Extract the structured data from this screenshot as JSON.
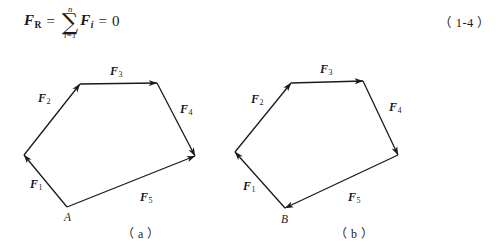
{
  "equation": {
    "lhs_symbol": "F",
    "lhs_subscript": "R",
    "equals_1": "=",
    "sum_upper": "n",
    "sum_symbol": "∑",
    "sum_lower": "i=1",
    "term_symbol": "F",
    "term_subscript": "i",
    "equals_2": "=",
    "rhs": "0",
    "number": "（ 1-4 ）"
  },
  "style": {
    "stroke_color": "#1a1a1a",
    "background": "#ffffff",
    "stroke_width": 1.3
  },
  "figures": [
    {
      "id": "figure-a",
      "caption": "（ a ）",
      "caption_x": 122,
      "caption_y": 228,
      "point_label": "A",
      "point_label_x": 64,
      "point_label_y": 212,
      "open_polygon": true,
      "vertices": {
        "A": [
          67,
          207
        ],
        "P1": [
          24,
          155
        ],
        "P2": [
          80,
          84
        ],
        "P3": [
          157,
          83
        ],
        "P4": [
          195,
          156
        ]
      },
      "forces": [
        {
          "name": "F",
          "sub": "1",
          "label_x": 30,
          "label_y": 178,
          "from": [
            67,
            207
          ],
          "to": [
            24,
            155
          ]
        },
        {
          "name": "F",
          "sub": "2",
          "label_x": 38,
          "label_y": 92,
          "from": [
            24,
            155
          ],
          "to": [
            80,
            84
          ]
        },
        {
          "name": "F",
          "sub": "3",
          "label_x": 110,
          "label_y": 65,
          "from": [
            80,
            84
          ],
          "to": [
            157,
            83
          ]
        },
        {
          "name": "F",
          "sub": "4",
          "label_x": 180,
          "label_y": 103,
          "from": [
            157,
            83
          ],
          "to": [
            195,
            156
          ]
        },
        {
          "name": "F",
          "sub": "5",
          "label_x": 140,
          "label_y": 191,
          "from": [
            67,
            207
          ],
          "to": [
            195,
            156
          ]
        }
      ]
    },
    {
      "id": "figure-b",
      "caption": "（ b ）",
      "caption_x": 335,
      "caption_y": 228,
      "point_label": "B",
      "point_label_x": 281,
      "point_label_y": 214,
      "open_polygon": false,
      "vertices": {
        "B": [
          285,
          208
        ],
        "P1": [
          235,
          152
        ],
        "P2": [
          291,
          83
        ],
        "P3": [
          363,
          81
        ],
        "P4": [
          398,
          155
        ]
      },
      "forces": [
        {
          "name": "F",
          "sub": "1",
          "label_x": 243,
          "label_y": 180,
          "from": [
            285,
            208
          ],
          "to": [
            235,
            152
          ]
        },
        {
          "name": "F",
          "sub": "2",
          "label_x": 251,
          "label_y": 93,
          "from": [
            235,
            152
          ],
          "to": [
            291,
            83
          ]
        },
        {
          "name": "F",
          "sub": "3",
          "label_x": 320,
          "label_y": 63,
          "from": [
            291,
            83
          ],
          "to": [
            363,
            81
          ]
        },
        {
          "name": "F",
          "sub": "4",
          "label_x": 389,
          "label_y": 101,
          "from": [
            363,
            81
          ],
          "to": [
            398,
            155
          ]
        },
        {
          "name": "F",
          "sub": "5",
          "label_x": 348,
          "label_y": 191,
          "from": [
            398,
            155
          ],
          "to": [
            285,
            208
          ]
        }
      ]
    }
  ]
}
